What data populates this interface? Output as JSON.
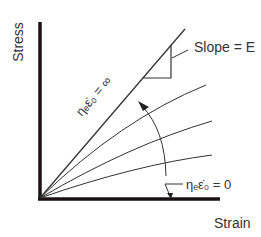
{
  "diagram": {
    "axes": {
      "x_label": "Strain",
      "y_label": "Stress"
    },
    "annotations": {
      "slope": "Slope = E",
      "upper_bound": "ηₑε̇₀ = ∞",
      "lower_bound": "ηₑε̇₀ = 0"
    },
    "curves": [
      {
        "name": "elastic-limit",
        "description": "straight line, slope E"
      },
      {
        "name": "curve-1"
      },
      {
        "name": "curve-2"
      },
      {
        "name": "curve-3"
      }
    ],
    "colors": {
      "axis": "#1a1212",
      "line": "#333333"
    }
  }
}
